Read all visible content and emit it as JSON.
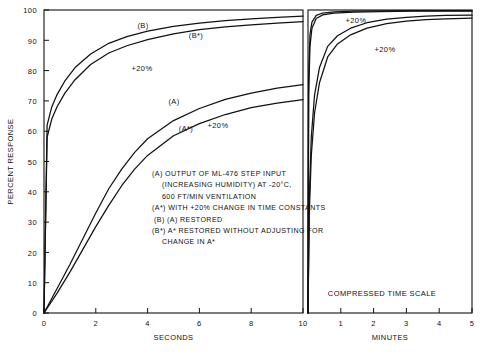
{
  "chart_data": {
    "type": "line",
    "title": "",
    "xlabel_left": "SECONDS",
    "xlabel_right": "MINUTES",
    "ylabel": "PERCENT RESPONSE",
    "ylim": [
      0,
      100
    ],
    "yticks": [
      0,
      10,
      20,
      30,
      40,
      50,
      60,
      70,
      80,
      90,
      100
    ],
    "ytick_labels": [
      "0",
      "10",
      "20",
      "30",
      "40",
      "50",
      "60",
      "70",
      "80",
      "90",
      "100"
    ],
    "grid": false,
    "legend_position": "inside-center",
    "panels": [
      {
        "name": "seconds-panel",
        "xlim": [
          0,
          10
        ],
        "xticks": [
          0,
          2,
          4,
          6,
          8,
          10
        ],
        "xtick_labels": [
          "0",
          "2",
          "4",
          "6",
          "8",
          "10"
        ],
        "note": ""
      },
      {
        "name": "minutes-panel",
        "xlim": [
          0,
          5
        ],
        "xticks": [
          1,
          2,
          3,
          4,
          5
        ],
        "xtick_labels": [
          "1",
          "2",
          "3",
          "4",
          "5"
        ],
        "note": "COMPRESSED TIME SCALE"
      }
    ],
    "series": [
      {
        "name": "B",
        "label": "(B)",
        "panel": "seconds-panel",
        "x": [
          0,
          0.12,
          0.3,
          0.5,
          0.8,
          1.2,
          1.8,
          2.5,
          3.2,
          4.0,
          5.0,
          6.0,
          7.0,
          8.0,
          9.0,
          10.0
        ],
        "y": [
          0,
          62,
          68,
          72,
          76.5,
          81,
          85.5,
          89,
          91.2,
          93,
          94.6,
          95.7,
          96.5,
          97.1,
          97.6,
          98.0
        ]
      },
      {
        "name": "B*",
        "label": "(B*)",
        "panel": "seconds-panel",
        "x": [
          0,
          0.12,
          0.3,
          0.5,
          0.8,
          1.2,
          1.8,
          2.5,
          3.2,
          4.0,
          5.0,
          6.0,
          7.0,
          8.0,
          9.0,
          10.0
        ],
        "y": [
          0,
          58,
          64,
          68,
          72.5,
          77,
          82,
          85.8,
          88.2,
          90.2,
          92.1,
          93.5,
          94.4,
          95.1,
          95.7,
          96.2
        ]
      },
      {
        "name": "A",
        "label": "(A)",
        "panel": "seconds-panel",
        "x": [
          0,
          0.5,
          1.0,
          1.5,
          2.0,
          2.5,
          3.0,
          3.5,
          4.0,
          5.0,
          6.0,
          7.0,
          8.0,
          9.0,
          10.0
        ],
        "y": [
          0,
          8,
          16,
          24.5,
          33,
          41,
          47.5,
          53,
          57.5,
          63.5,
          67.5,
          70.5,
          72.6,
          74.2,
          75.4
        ]
      },
      {
        "name": "A*",
        "label": "(A*)",
        "panel": "seconds-panel",
        "x": [
          0,
          0.5,
          1.0,
          1.5,
          2.0,
          2.5,
          3.0,
          3.5,
          4.0,
          5.0,
          6.0,
          7.0,
          8.0,
          9.0,
          10.0
        ],
        "y": [
          0,
          6.5,
          13.5,
          21,
          28.5,
          35.5,
          42,
          47.5,
          52,
          58.5,
          62.5,
          65.5,
          67.8,
          69.3,
          70.4
        ]
      },
      {
        "name": "B-right",
        "label": "",
        "panel": "minutes-panel",
        "x": [
          0,
          0.02,
          0.06,
          0.12,
          0.25,
          0.45,
          0.8,
          1.4,
          2.2,
          3.2,
          4.2,
          5.0
        ],
        "y": [
          0,
          78,
          92,
          96,
          98.2,
          99.0,
          99.4,
          99.6,
          99.7,
          99.8,
          99.8,
          99.8
        ]
      },
      {
        "name": "B*-right",
        "label": "",
        "panel": "minutes-panel",
        "x": [
          0,
          0.02,
          0.06,
          0.12,
          0.25,
          0.45,
          0.8,
          1.4,
          2.2,
          3.2,
          4.2,
          5.0
        ],
        "y": [
          0,
          72,
          88,
          94,
          97.2,
          98.4,
          99.0,
          99.3,
          99.5,
          99.6,
          99.6,
          99.6
        ]
      },
      {
        "name": "A-right",
        "label": "",
        "panel": "minutes-panel",
        "x": [
          0,
          0.04,
          0.1,
          0.2,
          0.35,
          0.6,
          0.9,
          1.3,
          1.8,
          2.4,
          3.0,
          3.6,
          4.2,
          5.0
        ],
        "y": [
          0,
          38,
          58,
          72,
          81,
          88,
          91.5,
          94,
          95.8,
          97.0,
          97.6,
          98.0,
          98.2,
          98.3
        ]
      },
      {
        "name": "A*-right",
        "label": "",
        "panel": "minutes-panel",
        "x": [
          0,
          0.04,
          0.1,
          0.2,
          0.35,
          0.6,
          0.9,
          1.3,
          1.8,
          2.4,
          3.0,
          3.6,
          4.2,
          5.0
        ],
        "y": [
          0,
          33,
          52,
          66,
          76,
          84.5,
          88.8,
          91.8,
          94.0,
          95.5,
          96.3,
          96.8,
          97.1,
          97.3
        ]
      }
    ],
    "annotations": [
      {
        "name": "label-B",
        "text": "(B)",
        "panel": "seconds-panel",
        "px": 143,
        "py": 28
      },
      {
        "name": "label-B-star",
        "text": "(B*)",
        "panel": "seconds-panel",
        "px": 196,
        "py": 38
      },
      {
        "name": "label-plus20-b",
        "text": "+20%",
        "panel": "seconds-panel",
        "px": 142,
        "py": 71
      },
      {
        "name": "label-A",
        "text": "(A)",
        "panel": "seconds-panel",
        "px": 174,
        "py": 104
      },
      {
        "name": "label-A-star",
        "text": "(A*)",
        "panel": "seconds-panel",
        "px": 186,
        "py": 131
      },
      {
        "name": "label-plus20-a",
        "text": "+20%",
        "panel": "seconds-panel",
        "px": 218,
        "py": 128
      },
      {
        "name": "label-plus20-r1",
        "text": "+20%",
        "panel": "minutes-panel",
        "px": 356,
        "py": 23
      },
      {
        "name": "label-plus20-r2",
        "text": "+20%",
        "panel": "minutes-panel",
        "px": 385,
        "py": 52
      }
    ],
    "legend_lines": [
      "(A) OUTPUT OF ML-476 STEP INPUT",
      "(INCREASING HUMIDITY) AT -20°C,",
      "600 FT/MIN VENTILATION",
      "(A*) WITH +20% CHANGE IN TIME CONSTANTS",
      "(B) (A) RESTORED",
      "(B*) A* RESTORED WITHOUT ADJUSTING FOR",
      "CHANGE IN A*"
    ],
    "colors": {
      "ink": "#111111",
      "background": "#ffffff",
      "axis": "#333333"
    }
  }
}
